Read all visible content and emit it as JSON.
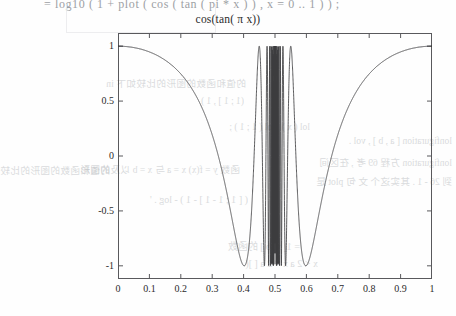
{
  "page": {
    "top_partial_text": "= log10 ( 1 + plot ( cos ( tan ( pi * x ) ) , x = 0 .. 1 ) ) ;",
    "background_bleed": [
      "(1 ; 1 ] , 1 )",
      "lol ( x ) , lol ( 1 ; 1 ) ;",
      "( [ 1 ; 1 - 1 ] - 1 ) - log . '",
      "= 1[ x, b ] 的函数",
      "x < 2 a  x < 2 a  [ ]( ",
      "的值和函数的图形的比较如下 in",
      "lonfiguration [ a , b ] , vol .",
      "lonfiguration  方程 69 考 , 在区间",
      "到 26 - 1 . 其实这个 文 句 plot 是",
      "函数 y = f(x)  x = a 与 x = b  以及的图形"
    ]
  },
  "chart_data": {
    "type": "line",
    "title": "cos(tan( π x))",
    "xlabel": "",
    "ylabel": "",
    "xlim": [
      0,
      1
    ],
    "ylim": [
      -1.12,
      1.12
    ],
    "grid": false,
    "legend": null,
    "x_ticks": [
      "0",
      "0.1",
      "0.2",
      "0.3",
      "0.4",
      "0.5",
      "0.6",
      "0.7",
      "0.8",
      "0.9",
      "1"
    ],
    "x_tick_values": [
      0,
      0.1,
      0.2,
      0.3,
      0.4,
      0.5,
      0.6,
      0.7,
      0.8,
      0.9,
      1
    ],
    "y_ticks": [
      "1",
      "0.5",
      "0",
      "-0.5",
      "-1"
    ],
    "y_tick_values": [
      1,
      0.5,
      0,
      -0.5,
      -1
    ],
    "series": [
      {
        "name": "cos(tan(pi*x))",
        "expression": "cos(tan(pi*x))",
        "color": "#3c3c3e",
        "samples": 6000,
        "x_range": [
          0,
          1
        ],
        "description": "Smooth near x=0 and x=1 where value is 1; decreasing to -1 near x=0.42 and x=0.58; extremely rapid oscillation between roughly x=0.40 and x=0.60 as tan(pi x) diverges at x=0.5"
      }
    ],
    "notable_points": [
      {
        "x": 0.0,
        "y": 1.0
      },
      {
        "x": 0.25,
        "y": 0.5403
      },
      {
        "x": 0.4,
        "y": -0.9992
      },
      {
        "x": 0.5,
        "y": null
      },
      {
        "x": 0.6,
        "y": -0.9992
      },
      {
        "x": 0.75,
        "y": 0.5403
      },
      {
        "x": 1.0,
        "y": 1.0
      }
    ]
  }
}
